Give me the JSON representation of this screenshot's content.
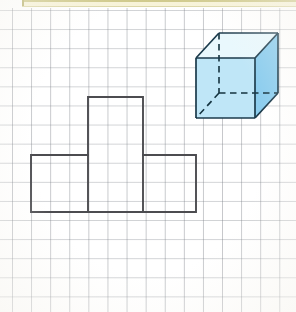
{
  "page": {
    "background_color": "#ffffff",
    "width": 296,
    "height": 312
  },
  "banner": {
    "name": "top-cream-strip",
    "fill_color": "#f7f3d8",
    "border_color": "#cfc98a",
    "left": 22,
    "height": 7
  },
  "grid": {
    "name": "graph-paper-grid",
    "cell_size_px": 19.1,
    "line_color": "#787c84",
    "origin_x": 12,
    "origin_y": 10,
    "columns": 15,
    "rows": 16
  },
  "net_shape": {
    "name": "t-shaped-net",
    "description": "T-shaped arrangement of four unit squares drawn on the grid",
    "stroke_color": "#4c4c50",
    "stroke_width": 1.9,
    "fill": "none",
    "cell_size_px": 57,
    "outline_points": "88,97 143,97 143,155 196,155 196,212 31,212 31,155 88,155 88,97",
    "interior_lines": [
      "88,155 88,212",
      "143,155 143,212"
    ],
    "squares": [
      {
        "name": "top-square",
        "x": 88,
        "y": 97,
        "w": 55,
        "h": 58
      },
      {
        "name": "bottom-left-square",
        "x": 31,
        "y": 155,
        "w": 57,
        "h": 57
      },
      {
        "name": "bottom-mid-square",
        "x": 88,
        "y": 155,
        "w": 55,
        "h": 57
      },
      {
        "name": "bottom-right-square",
        "x": 143,
        "y": 155,
        "w": 53,
        "h": 57
      }
    ]
  },
  "cube": {
    "name": "cube-diagram",
    "description": "Transparent 3D cube in oblique projection with dashed hidden edges",
    "edge_color": "#1b3a4b",
    "hidden_edge_color": "#14333f",
    "hidden_edge_dash": "6.5 4.5",
    "face_colors": {
      "front_left": "#bfe6f7",
      "right": "#8ccdee",
      "top": "#e9f8fd"
    },
    "vertices": {
      "front_top_left": [
        196,
        58
      ],
      "front_top_right": [
        255,
        58
      ],
      "front_bottom_right": [
        255,
        118
      ],
      "front_bottom_left": [
        196,
        118
      ],
      "back_top_left": [
        219,
        33
      ],
      "back_top_right": [
        278,
        33
      ],
      "back_bottom_right": [
        278,
        93
      ],
      "back_bottom_left": [
        219,
        93
      ]
    },
    "faces": {
      "front": "196,58 255,58 255,118 196,118",
      "top": "196,58 219,33 278,33 255,58",
      "right": "255,58 278,33 278,93 255,118"
    },
    "solid_edges": [
      "196,58 255,58",
      "255,58 255,118",
      "255,118 196,118",
      "196,118 196,58",
      "196,58 219,33",
      "219,33 278,33",
      "278,33 255,58",
      "278,33 278,93",
      "278,93 255,118"
    ],
    "hidden_edges": [
      "219,33 219,93",
      "219,93 278,93",
      "219,93 196,118"
    ]
  }
}
